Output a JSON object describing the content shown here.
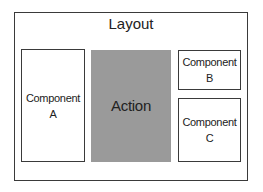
{
  "layout": {
    "title": "Layout"
  },
  "components": {
    "a": {
      "line1": "Component",
      "line2": "A"
    },
    "action": {
      "label": "Action",
      "fill": "#9a9a9a"
    },
    "b": {
      "line1": "Component",
      "line2": "B"
    },
    "c": {
      "line1": "Component",
      "line2": "C"
    }
  }
}
